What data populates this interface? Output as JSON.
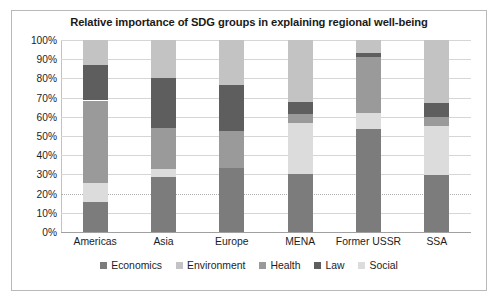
{
  "chart_data": {
    "type": "bar",
    "subtype": "stacked-100-percent",
    "title": "Relative importance of SDG groups in explaining regional well-being",
    "xlabel": "",
    "ylabel": "",
    "ylim": [
      0,
      100
    ],
    "ytick_labels": [
      "100%",
      "90%",
      "80%",
      "70%",
      "60%",
      "50%",
      "40%",
      "30%",
      "20%",
      "10%",
      "0%"
    ],
    "ytick_values": [
      100,
      90,
      80,
      70,
      60,
      50,
      40,
      30,
      20,
      10,
      0
    ],
    "grid": true,
    "legend_position": "bottom",
    "categories": [
      "Americas",
      "Asia",
      "Europe",
      "MENA",
      "Former USSR",
      "SSA"
    ],
    "series": [
      {
        "name": "Economics",
        "color": "#7c7c7c",
        "values": [
          15.5,
          28.5,
          33.5,
          30.0,
          53.5,
          29.5
        ]
      },
      {
        "name": "Social",
        "color": "#dcdcdc",
        "values": [
          10.0,
          4.5,
          0.0,
          27.0,
          8.5,
          25.5
        ]
      },
      {
        "name": "Health",
        "color": "#9a9a9a",
        "values": [
          43.0,
          21.0,
          19.0,
          4.5,
          29.0,
          5.0
        ]
      },
      {
        "name": "Law",
        "color": "#5e5e5e",
        "values": [
          18.5,
          26.0,
          24.0,
          6.0,
          2.0,
          7.0
        ]
      },
      {
        "name": "Environment",
        "color": "#c3c3c3",
        "values": [
          13.0,
          20.0,
          23.5,
          32.5,
          7.0,
          33.0
        ]
      }
    ],
    "stack_order": [
      "Economics",
      "Social",
      "Health",
      "Law",
      "Environment"
    ],
    "legend_entries": [
      {
        "label": "Economics",
        "color": "#7c7c7c"
      },
      {
        "label": "Environment",
        "color": "#c3c3c3"
      },
      {
        "label": "Health",
        "color": "#9a9a9a"
      },
      {
        "label": "Law",
        "color": "#5e5e5e"
      },
      {
        "label": "Social",
        "color": "#dcdcdc"
      }
    ]
  }
}
